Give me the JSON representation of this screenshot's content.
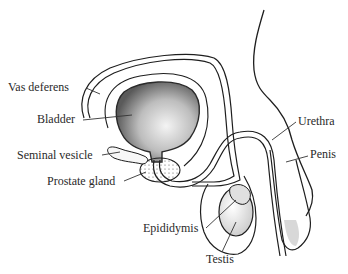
{
  "diagram": {
    "type": "anatomical-illustration",
    "labels": [
      {
        "id": "vas-deferens",
        "text": "Vas deferens"
      },
      {
        "id": "bladder",
        "text": "Bladder"
      },
      {
        "id": "seminal-vesicle",
        "text": "Seminal vesicle"
      },
      {
        "id": "prostate-gland",
        "text": "Prostate gland"
      },
      {
        "id": "epididymis",
        "text": "Epididymis"
      },
      {
        "id": "testis",
        "text": "Testis"
      },
      {
        "id": "urethra",
        "text": "Urethra"
      },
      {
        "id": "penis",
        "text": "Penis"
      }
    ],
    "colors": {
      "line": "#1e1e1e",
      "bladder_fill": "#9a9a9a",
      "text": "#2a2a2a",
      "background": "#ffffff"
    }
  }
}
